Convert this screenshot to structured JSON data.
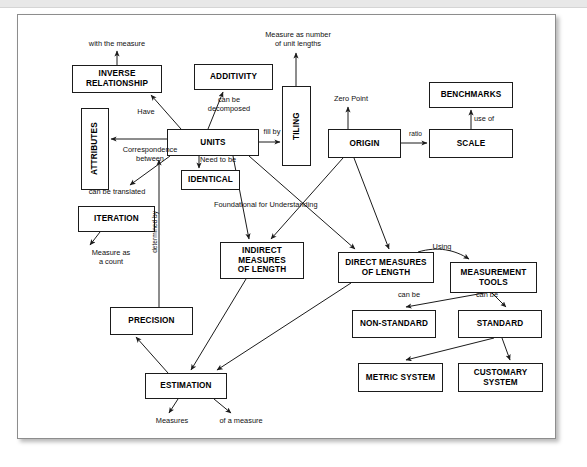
{
  "diagram": {
    "type": "concept-map",
    "page": {
      "background": "#ffffff",
      "border_color": "#8d8d8d"
    },
    "nodes": [
      {
        "id": "inverse-relationship",
        "label": "INVERSE\nRELATIONSHIP",
        "x": 54,
        "y": 50,
        "w": 90,
        "h": 28,
        "orientation": "horizontal"
      },
      {
        "id": "additivity",
        "label": "ADDITIVITY",
        "x": 176,
        "y": 49,
        "w": 79,
        "h": 26,
        "orientation": "horizontal"
      },
      {
        "id": "tiling",
        "label": "TILING",
        "x": 264,
        "y": 71,
        "w": 29,
        "h": 80,
        "orientation": "vertical"
      },
      {
        "id": "benchmarks",
        "label": "BENCHMARKS",
        "x": 411,
        "y": 67,
        "w": 84,
        "h": 26,
        "orientation": "horizontal"
      },
      {
        "id": "attributes",
        "label": "ATTRIBUTES",
        "x": 63,
        "y": 93,
        "w": 28,
        "h": 82,
        "orientation": "vertical"
      },
      {
        "id": "units",
        "label": "UNITS",
        "x": 149,
        "y": 114,
        "w": 92,
        "h": 27,
        "orientation": "horizontal"
      },
      {
        "id": "origin",
        "label": "ORIGIN",
        "x": 310,
        "y": 114,
        "w": 73,
        "h": 29,
        "orientation": "horizontal"
      },
      {
        "id": "scale",
        "label": "SCALE",
        "x": 411,
        "y": 114,
        "w": 84,
        "h": 29,
        "orientation": "horizontal"
      },
      {
        "id": "identical",
        "label": "IDENTICAL",
        "x": 163,
        "y": 155,
        "w": 59,
        "h": 20,
        "orientation": "horizontal"
      },
      {
        "id": "iteration",
        "label": "ITERATION",
        "x": 60,
        "y": 191,
        "w": 77,
        "h": 26,
        "orientation": "horizontal"
      },
      {
        "id": "indirect-measures-of-length",
        "label": "INDIRECT\nMEASURES\nOF LENGTH",
        "x": 202,
        "y": 227,
        "w": 84,
        "h": 37,
        "orientation": "horizontal"
      },
      {
        "id": "direct-measures-of-length",
        "label": "DIRECT MEASURES\nOF LENGTH",
        "x": 320,
        "y": 237,
        "w": 96,
        "h": 31,
        "orientation": "horizontal"
      },
      {
        "id": "measurement-tools",
        "label": "MEASUREMENT\nTOOLS",
        "x": 432,
        "y": 247,
        "w": 87,
        "h": 31,
        "orientation": "horizontal"
      },
      {
        "id": "precision",
        "label": "PRECISION",
        "x": 92,
        "y": 292,
        "w": 83,
        "h": 28,
        "orientation": "horizontal"
      },
      {
        "id": "non-standard",
        "label": "NON-STANDARD",
        "x": 334,
        "y": 295,
        "w": 84,
        "h": 28,
        "orientation": "horizontal"
      },
      {
        "id": "standard",
        "label": "STANDARD",
        "x": 440,
        "y": 295,
        "w": 84,
        "h": 28,
        "orientation": "horizontal"
      },
      {
        "id": "estimation",
        "label": "ESTIMATION",
        "x": 127,
        "y": 358,
        "w": 82,
        "h": 26,
        "orientation": "horizontal"
      },
      {
        "id": "metric-system",
        "label": "METRIC SYSTEM",
        "x": 340,
        "y": 348,
        "w": 85,
        "h": 29,
        "orientation": "horizontal"
      },
      {
        "id": "customary-system",
        "label": "CUSTOMARY\nSYSTEM",
        "x": 440,
        "y": 348,
        "w": 85,
        "h": 29,
        "orientation": "horizontal"
      }
    ],
    "link_labels": [
      {
        "id": "with-the-measure",
        "text": "with the measure",
        "x": 48,
        "y": 25,
        "w": 102,
        "rotated": false
      },
      {
        "id": "measure-as-number-of-unit-lengths",
        "text": "Measure as number\nof unit lengths",
        "x": 232,
        "y": 16,
        "w": 96,
        "rotated": false
      },
      {
        "id": "can-be-decomposed",
        "text": "can be\ndecomposed",
        "x": 180,
        "y": 81,
        "w": 62,
        "rotated": false
      },
      {
        "id": "zero-point",
        "text": "Zero Point",
        "x": 305,
        "y": 80,
        "w": 56,
        "rotated": false
      },
      {
        "id": "use-of",
        "text": "use of",
        "x": 456,
        "y": 100,
        "w": 38,
        "rotated": false
      },
      {
        "id": "have",
        "text": "Have",
        "x": 113,
        "y": 93,
        "w": 30,
        "rotated": false
      },
      {
        "id": "fill-by",
        "text": "fill by",
        "x": 240,
        "y": 113,
        "w": 28,
        "rotated": false
      },
      {
        "id": "ratio",
        "text": "ratio",
        "x": 386,
        "y": 115,
        "w": 23,
        "rotated": false
      },
      {
        "id": "correspondence-between",
        "text": "Correspondence\nbetween",
        "x": 92,
        "y": 131,
        "w": 80,
        "rotated": false
      },
      {
        "id": "need-to-be",
        "text": "Need to be",
        "x": 182,
        "y": 141,
        "w": 58,
        "rotated": false
      },
      {
        "id": "can-be-translated",
        "text": "can be translated",
        "x": 55,
        "y": 173,
        "w": 88,
        "rotated": false
      },
      {
        "id": "foundational-for-understanding",
        "text": "Foundational for Understanding",
        "x": 196,
        "y": 186,
        "w": 152,
        "rotated": false
      },
      {
        "id": "determined-by",
        "text": "determined by",
        "x": 136,
        "y": 196,
        "w": 11,
        "rotated": true
      },
      {
        "id": "using",
        "text": "Using",
        "x": 408,
        "y": 228,
        "w": 32,
        "rotated": false
      },
      {
        "id": "measure-as-a-count",
        "text": "Measure as\na count",
        "x": 62,
        "y": 234,
        "w": 62,
        "rotated": false
      },
      {
        "id": "can-be-left",
        "text": "can be",
        "x": 374,
        "y": 276,
        "w": 34,
        "rotated": false
      },
      {
        "id": "can-be-right",
        "text": "can be",
        "x": 452,
        "y": 276,
        "w": 34,
        "rotated": false
      },
      {
        "id": "measures",
        "text": "Measures",
        "x": 128,
        "y": 402,
        "w": 52,
        "rotated": false
      },
      {
        "id": "of-a-measure",
        "text": "of a measure",
        "x": 190,
        "y": 402,
        "w": 66,
        "rotated": false
      }
    ],
    "edges": [
      {
        "id": "inverse-to-with-the-measure",
        "from": "inverse-relationship",
        "to": "with-the-measure",
        "label": "with the measure"
      },
      {
        "id": "units-to-inverse",
        "from": "units",
        "to": "inverse-relationship",
        "label": "Have"
      },
      {
        "id": "units-to-additivity",
        "from": "units",
        "to": "additivity",
        "label": "can be decomposed"
      },
      {
        "id": "units-to-tiling",
        "from": "units",
        "to": "tiling",
        "label": "fill by"
      },
      {
        "id": "tiling-to-measure-as-number",
        "from": "tiling",
        "to": "measure-as-number-of-unit-lengths",
        "label": "Measure as number of unit lengths"
      },
      {
        "id": "units-to-attributes",
        "from": "units",
        "to": "attributes",
        "label": "Correspondence between"
      },
      {
        "id": "units-to-identical",
        "from": "units",
        "to": "identical",
        "label": "Need to be"
      },
      {
        "id": "units-to-iteration",
        "from": "units",
        "to": "iteration",
        "label": "can be translated"
      },
      {
        "id": "iteration-to-measure-as-a-count",
        "from": "iteration",
        "to": "measure-as-a-count",
        "label": "Measure as a count"
      },
      {
        "id": "precision-to-units",
        "from": "precision",
        "to": "units",
        "label": "determined by"
      },
      {
        "id": "units-to-indirect",
        "from": "units",
        "to": "indirect-measures-of-length",
        "label": ""
      },
      {
        "id": "units-to-direct",
        "from": "units",
        "to": "direct-measures-of-length",
        "label": "Foundational for Understanding"
      },
      {
        "id": "origin-to-zero-point",
        "from": "origin",
        "to": "zero-point",
        "label": "Zero Point"
      },
      {
        "id": "origin-to-scale",
        "from": "origin",
        "to": "scale",
        "label": "ratio"
      },
      {
        "id": "scale-to-benchmarks",
        "from": "scale",
        "to": "benchmarks",
        "label": "use of"
      },
      {
        "id": "origin-to-indirect",
        "from": "origin",
        "to": "indirect-measures-of-length",
        "label": ""
      },
      {
        "id": "origin-to-direct",
        "from": "origin",
        "to": "direct-measures-of-length",
        "label": ""
      },
      {
        "id": "direct-to-measurement-tools",
        "from": "direct-measures-of-length",
        "to": "measurement-tools",
        "label": "Using"
      },
      {
        "id": "tools-to-non-standard",
        "from": "measurement-tools",
        "to": "non-standard",
        "label": "can be"
      },
      {
        "id": "tools-to-standard",
        "from": "measurement-tools",
        "to": "standard",
        "label": "can be"
      },
      {
        "id": "standard-to-metric",
        "from": "standard",
        "to": "metric-system",
        "label": ""
      },
      {
        "id": "standard-to-customary",
        "from": "standard",
        "to": "customary-system",
        "label": ""
      },
      {
        "id": "indirect-to-estimation",
        "from": "indirect-measures-of-length",
        "to": "estimation",
        "label": ""
      },
      {
        "id": "direct-to-estimation",
        "from": "direct-measures-of-length",
        "to": "estimation",
        "label": ""
      },
      {
        "id": "estimation-to-precision",
        "from": "estimation",
        "to": "precision",
        "label": ""
      },
      {
        "id": "estimation-to-measures",
        "from": "estimation",
        "to": "measures",
        "label": "Measures"
      },
      {
        "id": "estimation-to-of-a-measure",
        "from": "estimation",
        "to": "of-a-measure",
        "label": "of a measure"
      }
    ]
  }
}
